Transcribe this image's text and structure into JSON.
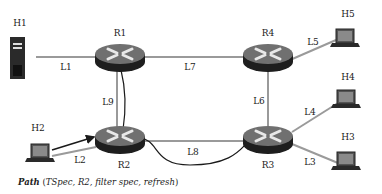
{
  "nodes": {
    "h1": "H1",
    "h2": "H2",
    "h3": "H3",
    "h4": "H4",
    "h5": "H5",
    "r1": "R1",
    "r2": "R2",
    "r3": "R3",
    "r4": "R4"
  },
  "links": {
    "l1": "L1",
    "l2": "L2",
    "l3": "L3",
    "l4": "L4",
    "l5": "L5",
    "l6": "L6",
    "l7": "L7",
    "l8": "L8",
    "l9": "L9"
  },
  "caption": {
    "keyword": "Path",
    "open": " (",
    "args": "TSpec, R2, filter spec, refresh",
    "close": ")"
  },
  "colors": {
    "link": "#9a9a9a",
    "path": "#1a1a1a",
    "router_top": "#6e6e6e",
    "router_body": "#1e1e1e"
  }
}
